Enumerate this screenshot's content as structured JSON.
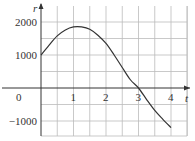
{
  "chart_data": {
    "type": "line",
    "title": "",
    "xlabel": "t",
    "ylabel": "r",
    "x_ticks": [
      "0",
      "1",
      "2",
      "3",
      "4"
    ],
    "y_ticks": [
      "2000",
      "1000",
      "-1000"
    ],
    "xlim": [
      0,
      4.5
    ],
    "ylim": [
      -1400,
      2400
    ],
    "grid": true,
    "legend": null,
    "series": [
      {
        "name": "r(t)",
        "x": [
          0,
          0.25,
          0.5,
          0.75,
          1.0,
          1.25,
          1.5,
          1.75,
          2.0,
          2.25,
          2.5,
          2.75,
          3.0,
          3.25,
          3.5,
          3.75,
          4.0
        ],
        "y": [
          1000,
          1300,
          1580,
          1760,
          1850,
          1850,
          1780,
          1600,
          1350,
          1000,
          620,
          250,
          0,
          -350,
          -680,
          -950,
          -1200
        ]
      }
    ]
  }
}
